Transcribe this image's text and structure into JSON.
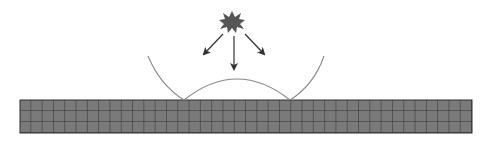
{
  "diagram": {
    "description": "Point source emitting rays toward a gridded slab, with wavefront arcs",
    "source": {
      "shape": "starburst",
      "cx": 232,
      "cy": 22,
      "color": "#555555"
    },
    "arrows": [
      {
        "x1": 223,
        "y1": 34,
        "x2": 204,
        "y2": 54
      },
      {
        "x1": 234,
        "y1": 36,
        "x2": 234,
        "y2": 69
      },
      {
        "x1": 245,
        "y1": 34,
        "x2": 264,
        "y2": 54
      }
    ],
    "outer_arc": {
      "left_top": [
        148,
        56
      ],
      "left_bottom": [
        184,
        100
      ],
      "right_bottom": [
        290,
        100
      ],
      "right_top": [
        324,
        56
      ]
    },
    "inner_arc": {
      "start": [
        184,
        100
      ],
      "peak": [
        237,
        79
      ],
      "end": [
        290,
        100
      ]
    },
    "slab": {
      "x": 20,
      "y": 100,
      "width": 452,
      "height": 33,
      "fill": "#7a7a7a",
      "grid_color": "#2e2e2e",
      "cell_w": 11.3,
      "rows": 3
    },
    "colors": {
      "line": "#888888",
      "arrow": "#333333",
      "background": "#ffffff"
    }
  }
}
